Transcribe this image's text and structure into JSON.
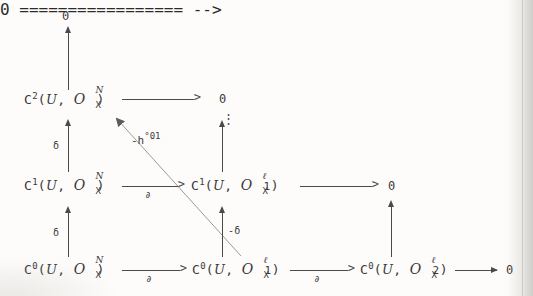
{
  "diagram": {
    "background_color": "#fdfcfa",
    "ink_color": "#3a393b",
    "nodes": {
      "top_zero": "0",
      "c2_N": {
        "functor": "C",
        "degree": "2",
        "cover": "U",
        "sheaf": "O",
        "sheaf_sub": "X",
        "sheaf_sup": "N"
      },
      "mid_zero": "0",
      "c1_N": {
        "functor": "C",
        "degree": "1",
        "cover": "U",
        "sheaf": "O",
        "sheaf_sub": "X",
        "sheaf_sup": "N"
      },
      "c1_l1": {
        "functor": "C",
        "degree": "1",
        "cover": "U",
        "sheaf": "O",
        "sheaf_sub": "X",
        "sheaf_sup": "ℓ",
        "sheaf_sup_tail": "1"
      },
      "right_zero": "0",
      "c0_N": {
        "functor": "C",
        "degree": "0",
        "cover": "U",
        "sheaf": "O",
        "sheaf_sub": "X",
        "sheaf_sup": "N"
      },
      "c0_l1": {
        "functor": "C",
        "degree": "0",
        "cover": "U",
        "sheaf": "O",
        "sheaf_sub": "X",
        "sheaf_sup": "ℓ",
        "sheaf_sup_tail": "1"
      },
      "c0_l2": {
        "functor": "C",
        "degree": "0",
        "cover": "U",
        "sheaf": "O",
        "sheaf_sub": "X",
        "sheaf_sup": "ℓ",
        "sheaf_sup_tail": "2"
      },
      "far_right_zero": "0"
    },
    "arrow_labels": {
      "delta_upper_left": "δ",
      "delta_lower_left": "δ",
      "delta_neg_middle": "-δ",
      "partial_mid_row": "∂",
      "partial_bottom_left": "∂",
      "partial_bottom_right": "∂",
      "homotopy": "-h",
      "homotopy_sup": "°01"
    },
    "ellipsis": "⋮"
  }
}
